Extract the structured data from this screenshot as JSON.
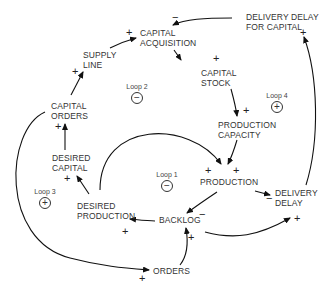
{
  "diagram": {
    "type": "causal-loop-diagram",
    "nodes": {
      "delivery_delay_for_capital": [
        "DELIVERY DELAY",
        "FOR CAPITAL"
      ],
      "capital_acquisition": [
        "CAPITAL",
        "ACQUISITION"
      ],
      "supply_line": [
        "SUPPLY",
        "LINE"
      ],
      "capital_stock": [
        "CAPITAL",
        "STOCK"
      ],
      "capital_orders": [
        "CAPITAL",
        "ORDERS"
      ],
      "production_capacity": [
        "PRODUCTION",
        "CAPACITY"
      ],
      "desired_capital": [
        "DESIRED",
        "CAPITAL"
      ],
      "production": [
        "PRODUCTION"
      ],
      "delivery_delay": [
        "DELIVERY",
        "DELAY"
      ],
      "desired_production": [
        "DESIRED",
        "PRODUCTION"
      ],
      "backlog": [
        "BACKLOG"
      ],
      "orders": [
        "ORDERS"
      ]
    },
    "loops": [
      {
        "label": "Loop 1",
        "polarity": "−"
      },
      {
        "label": "Loop 2",
        "polarity": "−"
      },
      {
        "label": "Loop 3",
        "polarity": "+"
      },
      {
        "label": "Loop 4",
        "polarity": "+"
      }
    ],
    "links": [
      {
        "from": "DELIVERY DELAY FOR CAPITAL",
        "to": "CAPITAL ACQUISITION",
        "sign": "−"
      },
      {
        "from": "SUPPLY LINE",
        "to": "CAPITAL ACQUISITION",
        "sign": "+"
      },
      {
        "from": "CAPITAL ACQUISITION",
        "to": "CAPITAL STOCK",
        "sign": "+"
      },
      {
        "from": "CAPITAL ORDERS",
        "to": "SUPPLY LINE",
        "sign": "+"
      },
      {
        "from": "CAPITAL STOCK",
        "to": "PRODUCTION CAPACITY",
        "sign": "+"
      },
      {
        "from": "DESIRED CAPITAL",
        "to": "CAPITAL ORDERS",
        "sign": "+"
      },
      {
        "from": "PRODUCTION CAPACITY",
        "to": "PRODUCTION",
        "sign": "+"
      },
      {
        "from": "DESIRED PRODUCTION",
        "to": "PRODUCTION",
        "sign": "+"
      },
      {
        "from": "DESIRED PRODUCTION",
        "to": "DESIRED CAPITAL",
        "sign": "+"
      },
      {
        "from": "PRODUCTION",
        "to": "BACKLOG",
        "sign": "−"
      },
      {
        "from": "PRODUCTION",
        "to": "DELIVERY DELAY",
        "sign": "−"
      },
      {
        "from": "BACKLOG",
        "to": "DESIRED PRODUCTION",
        "sign": "+"
      },
      {
        "from": "BACKLOG",
        "to": "DELIVERY DELAY",
        "sign": "+"
      },
      {
        "from": "ORDERS",
        "to": "BACKLOG",
        "sign": "+"
      },
      {
        "from": "CAPITAL ORDERS",
        "to": "ORDERS",
        "sign": "+"
      },
      {
        "from": "DELIVERY DELAY",
        "to": "DELIVERY DELAY FOR CAPITAL",
        "sign": "+"
      }
    ],
    "signs": {
      "plus": "+",
      "minus": "−"
    }
  }
}
